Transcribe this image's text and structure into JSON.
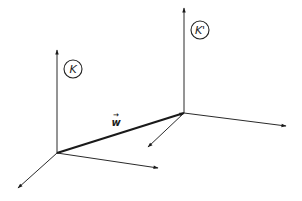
{
  "diagram": {
    "frames": [
      {
        "id": "K",
        "label": "K",
        "origin": [
          57,
          153
        ],
        "axes": {
          "vertical_end": [
            57,
            50
          ],
          "right_end": [
            158,
            168
          ],
          "down_left_end": [
            18,
            188
          ]
        },
        "label_pos": [
          73,
          69
        ]
      },
      {
        "id": "K_prime",
        "label": "K'",
        "origin": [
          184,
          113
        ],
        "axes": {
          "vertical_end": [
            184,
            8
          ],
          "right_end": [
            286,
            126
          ],
          "down_left_end": [
            148,
            147
          ]
        },
        "label_pos": [
          200,
          30
        ]
      }
    ],
    "vector": {
      "label": "w",
      "arrow_symbol": "→",
      "from": "K",
      "to": "K'",
      "label_pos": [
        116,
        123
      ]
    },
    "colors": {
      "line": "#2a2a2a",
      "background": "#ffffff"
    }
  }
}
